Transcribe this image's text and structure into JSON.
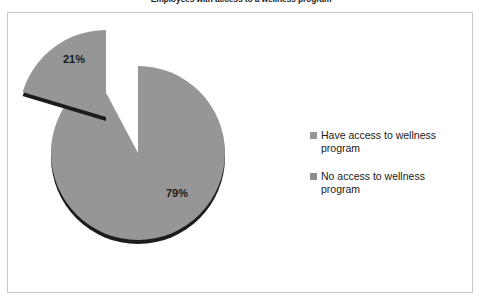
{
  "chart_data": {
    "type": "pie",
    "title": "Employees with access to a wellness program",
    "categories": [
      "Have access to wellness program",
      "No access to wellness program"
    ],
    "values": [
      79,
      21
    ],
    "data_labels": [
      "79%",
      "21%"
    ],
    "colors": [
      "#969696",
      "#8c8c8c"
    ],
    "shadow_color": "#1c1c1c",
    "exploded_slice": "No access to wellness program",
    "legend_position": "right",
    "grid": false,
    "xlabel": "",
    "ylabel": ""
  },
  "title": {
    "text": "Employees with access to a wellness program"
  },
  "labels": {
    "small_slice": "21%",
    "large_slice": "79%"
  },
  "legend": {
    "items": [
      {
        "label": "Have access to wellness program",
        "color": "#969696"
      },
      {
        "label": "No access to wellness program",
        "color": "#8c8c8c"
      }
    ]
  }
}
